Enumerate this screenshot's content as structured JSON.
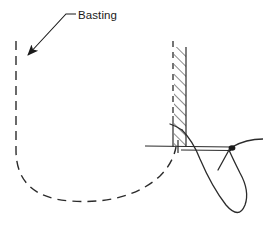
{
  "figure": {
    "kind": "technical-line-illustration",
    "width": 265,
    "height": 229,
    "background_color": "#ffffff",
    "line_color": "#2b2b2b",
    "hatch_color": "#2b2b2b"
  },
  "annotations": [
    {
      "id": "basting",
      "label": "Basting",
      "text_x": 78,
      "text_y": 19,
      "leader": {
        "horizontal_start_x": 66,
        "horizontal_end_x": 76,
        "horizontal_y": 14,
        "diagonal_end_x": 27,
        "diagonal_end_y": 56
      },
      "arrow": {
        "tip_x": 24,
        "tip_y": 61,
        "direction": "down-left"
      }
    }
  ],
  "elements": {
    "basting_thread": {
      "name": "dashed-basting-line",
      "style": "dashed",
      "dash_pattern": "9 6",
      "stroke_width": 1.4,
      "path": "M 16,41 L 16,150 Q 16,197 70,201 Q 128,205 160,175 Q 173,163 176,146"
    },
    "fabric_edge": {
      "name": "fabric-fold-edge-dashed",
      "style": "dashed",
      "dash_pattern": "6 5",
      "stroke_width": 1.3,
      "path": "M 173,41 L 173,146"
    },
    "seam_allowance_band": {
      "name": "hatched-seam-band",
      "left_x": 173,
      "right_x": 186,
      "top_y": 47,
      "bottom_y": 146,
      "hatch_angle_deg": 45,
      "hatch_spacing": 7,
      "stroke_width": 1.1
    },
    "seam_band_right_edge": {
      "name": "seam-band-right-edge",
      "path": "M 186,47 L 186,146",
      "stroke_width": 1.2
    },
    "needle": {
      "name": "needle-shaft",
      "left_tip_x": 145,
      "left_tip_y": 146,
      "right_end_x": 263,
      "right_end_y": 140,
      "eye_x": 232,
      "eye_y": 147,
      "stroke_width": 1.2,
      "upper_path": "M 145,146 L 178,146 M 181,146 L 232,147",
      "lower_path": "M 181,149 L 231,150",
      "tail_path": "M 232,147 Q 245,139 263,139"
    },
    "needle_eye_marker": {
      "name": "needle-eye-knot",
      "cx": 232,
      "cy": 148,
      "rx": 3.2,
      "ry": 2.6
    },
    "needle_cross_tick": {
      "name": "needle-left-crosstick",
      "path": "M 178,140 L 178,153",
      "stroke_width": 1.2
    },
    "fabric_vertical_tick": {
      "name": "fabric-vertical-tick",
      "path": "M 173,118 L 173,146",
      "stroke_width": 1.2
    },
    "thread_loop": {
      "name": "thread-loop",
      "stroke_width": 1.3,
      "path": "M 182,130 Q 192,140 199,158 Q 212,186 226,205 Q 238,219 244,206 Q 249,192 240,174 Q 231,156 229,150"
    },
    "thread_tail_upper": {
      "name": "thread-tail-upper",
      "stroke_width": 1.3,
      "path": "M 182,130 Q 176,126 170,124"
    },
    "thread_tail_lower": {
      "name": "thread-tail-lower",
      "stroke_width": 1.3,
      "path": "M 229,150 Q 224,158 219,168"
    }
  }
}
